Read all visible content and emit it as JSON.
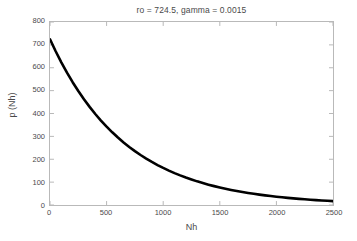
{
  "figure": {
    "background_color": "#ffffff",
    "axis_color": "#b9b9b9",
    "text_color": "#4a4a4a",
    "curve_color": "#000000"
  },
  "chart_data": {
    "type": "line",
    "title": "ro = 724.5, gamma = 0.0015",
    "xlabel": "Nh",
    "ylabel": "p (Nh)",
    "xlim": [
      0,
      2500
    ],
    "ylim": [
      0,
      800
    ],
    "grid": false,
    "legend": null,
    "xticks": [
      0,
      500,
      1000,
      1500,
      2000,
      2500
    ],
    "xtick_labels": [
      "0",
      "500",
      "1000",
      "1500",
      "2000",
      "2500"
    ],
    "yticks": [
      0,
      100,
      200,
      300,
      400,
      500,
      600,
      700,
      800
    ],
    "ytick_labels": [
      "0",
      "100",
      "200",
      "300",
      "400",
      "500",
      "600",
      "700",
      "800"
    ],
    "parameters": {
      "ro": 724.5,
      "gamma": 0.0015,
      "equation": "p(Nh) = ro * exp(-gamma * Nh)"
    },
    "line_width": 2.6,
    "series": [
      {
        "name": "p (Nh)",
        "color": "#000000",
        "x": [
          0,
          50,
          100,
          150,
          200,
          250,
          300,
          350,
          400,
          450,
          500,
          550,
          600,
          650,
          700,
          750,
          800,
          850,
          900,
          950,
          1000,
          1050,
          1100,
          1150,
          1200,
          1250,
          1300,
          1350,
          1400,
          1450,
          1500,
          1550,
          1600,
          1650,
          1700,
          1750,
          1800,
          1850,
          1900,
          1950,
          2000,
          2050,
          2100,
          2150,
          2200,
          2250,
          2300,
          2350,
          2400,
          2450,
          2500
        ],
        "y": [
          724.5,
          672.2,
          623.7,
          578.7,
          536.9,
          498.2,
          462.2,
          428.9,
          397.9,
          369.2,
          342.6,
          317.8,
          294.9,
          273.6,
          253.9,
          235.5,
          218.5,
          202.8,
          188.1,
          174.6,
          162.0,
          150.3,
          139.4,
          129.4,
          120.0,
          111.4,
          103.3,
          95.9,
          89.0,
          82.5,
          76.6,
          71.1,
          65.9,
          61.2,
          56.8,
          52.7,
          48.9,
          45.3,
          42.1,
          39.0,
          36.2,
          33.6,
          31.2,
          28.9,
          26.8,
          24.9,
          23.1,
          21.4,
          19.9,
          18.5,
          17.1
        ]
      }
    ]
  }
}
